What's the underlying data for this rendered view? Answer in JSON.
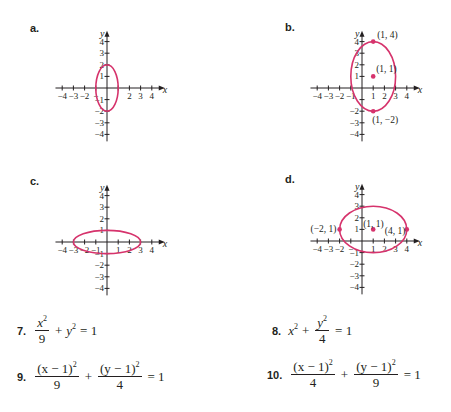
{
  "style": {
    "axis_color": "#231f20",
    "curve_color": "#d6336c",
    "point_color": "#d6336c"
  },
  "graphs": [
    {
      "id": "a",
      "label": "a.",
      "label_pos": [
        30,
        22
      ],
      "origin": [
        107,
        88
      ],
      "unit": [
        11.2,
        11.6
      ],
      "x_ticks": [
        -4,
        -3,
        -2,
        -1,
        1,
        2,
        3,
        4
      ],
      "x_tick_labels": [
        "-4",
        "-3",
        "-2",
        "-",
        "",
        "2",
        "3",
        "4"
      ],
      "y_ticks": [
        -4,
        -3,
        -2,
        -1,
        1,
        2,
        3,
        4
      ],
      "y_tick_labels": [
        "-4",
        "-3",
        "-2",
        "-1",
        "1",
        "2",
        "3",
        "4"
      ],
      "x_axis_label": "x",
      "y_axis_label": "y",
      "ellipse": {
        "cx": 0,
        "cy": 0,
        "rx": 1,
        "ry": 2
      },
      "points": [],
      "point_labels": []
    },
    {
      "id": "b",
      "label": "b.",
      "label_pos": [
        285,
        21
      ],
      "origin": [
        362,
        88
      ],
      "unit": [
        11.2,
        11.6
      ],
      "x_ticks": [
        -4,
        -3,
        -2,
        -1,
        1,
        2,
        3,
        4
      ],
      "x_tick_labels": [
        "-4",
        "-3",
        "-2",
        "-1",
        "1",
        "2",
        "3",
        "4"
      ],
      "y_ticks": [
        -4,
        -3,
        -2,
        -1,
        1,
        2,
        3,
        4
      ],
      "y_tick_labels": [
        "-4",
        "-3",
        "-2",
        "",
        "1",
        "2",
        "3",
        "4"
      ],
      "x_axis_label": "x",
      "y_axis_label": "y",
      "ellipse": {
        "cx": 1,
        "cy": 1,
        "rx": 2,
        "ry": 3
      },
      "points": [
        [
          1,
          4
        ],
        [
          1,
          1
        ],
        [
          1,
          -2
        ]
      ],
      "point_labels": [
        {
          "text": "(1, 4)",
          "at": [
            1,
            4
          ],
          "dx": 4,
          "dy": -4
        },
        {
          "text": "(1, 1)",
          "at": [
            1,
            1
          ],
          "dx": 3,
          "dy": -4
        },
        {
          "text": "(1, −2)",
          "at": [
            1,
            -2
          ],
          "dx": -1,
          "dy": 12
        }
      ]
    },
    {
      "id": "c",
      "label": "c.",
      "label_pos": [
        30,
        175
      ],
      "origin": [
        107,
        242
      ],
      "unit": [
        11.2,
        11.6
      ],
      "x_ticks": [
        -4,
        -3,
        -2,
        -1,
        1,
        2,
        3,
        4
      ],
      "x_tick_labels": [
        "-4",
        "-3",
        "-2",
        "-1",
        "1",
        "2",
        "3",
        "4"
      ],
      "y_ticks": [
        -4,
        -3,
        -2,
        -1,
        1,
        2,
        3,
        4
      ],
      "y_tick_labels": [
        "-4",
        "-3",
        "-2",
        "-1",
        "1",
        "2",
        "3",
        "4"
      ],
      "x_axis_label": "x",
      "y_axis_label": "y",
      "ellipse": {
        "cx": 0,
        "cy": 0,
        "rx": 3,
        "ry": 1
      },
      "points": [],
      "point_labels": []
    },
    {
      "id": "d",
      "label": "d.",
      "label_pos": [
        285,
        173
      ],
      "origin": [
        362,
        241
      ],
      "unit": [
        11.2,
        11.6
      ],
      "x_ticks": [
        -4,
        -3,
        -2,
        -1,
        1,
        2,
        3,
        4
      ],
      "x_tick_labels": [
        "-4",
        "-3",
        "-2",
        "-",
        "1",
        "2",
        "3",
        "4"
      ],
      "y_ticks": [
        -4,
        -3,
        -2,
        -1,
        1,
        2,
        3,
        4
      ],
      "y_tick_labels": [
        "-4",
        "-3",
        "-2",
        "-1",
        "1",
        "2",
        "3",
        "4"
      ],
      "x_axis_label": "x",
      "y_axis_label": "y",
      "ellipse": {
        "cx": 1,
        "cy": 1,
        "rx": 3,
        "ry": 2
      },
      "points": [
        [
          -2,
          1
        ],
        [
          1,
          1
        ],
        [
          4,
          1
        ]
      ],
      "point_labels": [
        {
          "text": "(−2, 1)",
          "at": [
            -2,
            1
          ],
          "dx": -29,
          "dy": 3
        },
        {
          "text": "(1, 1)",
          "at": [
            1,
            1
          ],
          "dx": -10,
          "dy": -2
        },
        {
          "text": "(4, 1)",
          "at": [
            4,
            1
          ],
          "dx": -22,
          "dy": 5
        }
      ]
    }
  ],
  "equations": {
    "e7": {
      "number": "7.",
      "a_num": "x",
      "a_den": "9",
      "plus": "+",
      "b": "y",
      "eq": "= 1"
    },
    "e8": {
      "number": "8.",
      "a": "x",
      "plus": "+",
      "b_num": "y",
      "b_den": "4",
      "eq": "= 1"
    },
    "e9": {
      "number": "9.",
      "a_num": "(x − 1)",
      "a_den": "9",
      "plus": "+",
      "b_num": "(y − 1)",
      "b_den": "4",
      "eq": "= 1"
    },
    "e10": {
      "number": "10.",
      "a_num": "(x − 1)",
      "a_den": "4",
      "plus": "+",
      "b_num": "(y − 1)",
      "b_den": "9",
      "eq": "= 1"
    },
    "exp": "2"
  }
}
